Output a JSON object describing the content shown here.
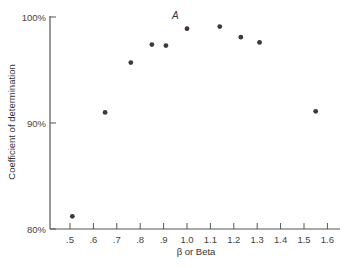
{
  "chart_data": {
    "type": "scatter",
    "title": "",
    "xlabel": "β or Beta",
    "ylabel": "Coefficient of determination",
    "xlim": [
      0.4,
      1.65
    ],
    "ylim": [
      80,
      100
    ],
    "grid": false,
    "legend": null,
    "x_ticks": [
      ".5",
      ".6",
      ".7",
      ".8",
      ".9",
      "1.0",
      "1.1",
      "1.2",
      "1.3",
      "1.4",
      "1.5",
      "1.6"
    ],
    "x_tick_values": [
      0.5,
      0.6,
      0.7,
      0.8,
      0.9,
      1.0,
      1.1,
      1.2,
      1.3,
      1.4,
      1.5,
      1.6
    ],
    "y_ticks": [
      "80%",
      "90%",
      "100%"
    ],
    "y_tick_values": [
      80,
      90,
      100
    ],
    "series": [
      {
        "name": "portfolios",
        "x": [
          0.51,
          0.65,
          0.76,
          0.85,
          0.91,
          1.0,
          1.14,
          1.23,
          1.31,
          1.55
        ],
        "y": [
          81.2,
          91.0,
          95.7,
          97.4,
          97.3,
          98.9,
          99.1,
          98.1,
          97.6,
          91.1
        ]
      }
    ],
    "annotations": [
      {
        "text": "A",
        "x": 0.98,
        "y": 100.0
      }
    ]
  },
  "labels": {
    "xlabel": "β or Beta",
    "ylabel": "Coefficient of determination",
    "annotation_a": "A"
  }
}
